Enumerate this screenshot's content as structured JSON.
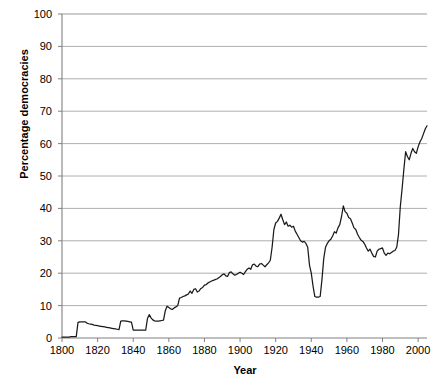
{
  "chart_data": {
    "type": "line",
    "title": "",
    "xlabel": "Year",
    "ylabel": "Percentage democracies",
    "xlim": [
      1800,
      2005
    ],
    "ylim": [
      0,
      100
    ],
    "xticks": [
      1800,
      1820,
      1840,
      1860,
      1880,
      1900,
      1920,
      1940,
      1960,
      1980,
      2000
    ],
    "yticks": [
      0,
      10,
      20,
      30,
      40,
      50,
      60,
      70,
      80,
      90,
      100
    ],
    "grid": "horizontal",
    "legend": "none",
    "line_color": "#1a1a1a",
    "grid_color": "#999999",
    "axis_color": "#808080",
    "background": "#ffffff",
    "series": [
      {
        "name": "Percentage democracies",
        "x": [
          1800,
          1801,
          1802,
          1803,
          1804,
          1805,
          1806,
          1807,
          1808,
          1809,
          1810,
          1811,
          1812,
          1813,
          1814,
          1815,
          1816,
          1817,
          1818,
          1819,
          1820,
          1821,
          1822,
          1823,
          1824,
          1825,
          1826,
          1827,
          1828,
          1829,
          1830,
          1831,
          1832,
          1833,
          1834,
          1835,
          1836,
          1837,
          1838,
          1839,
          1840,
          1841,
          1842,
          1843,
          1844,
          1845,
          1846,
          1847,
          1848,
          1849,
          1850,
          1851,
          1852,
          1853,
          1854,
          1855,
          1856,
          1857,
          1858,
          1859,
          1860,
          1861,
          1862,
          1863,
          1864,
          1865,
          1866,
          1867,
          1868,
          1869,
          1870,
          1871,
          1872,
          1873,
          1874,
          1875,
          1876,
          1877,
          1878,
          1879,
          1880,
          1881,
          1882,
          1883,
          1884,
          1885,
          1886,
          1887,
          1888,
          1889,
          1890,
          1891,
          1892,
          1893,
          1894,
          1895,
          1896,
          1897,
          1898,
          1899,
          1900,
          1901,
          1902,
          1903,
          1904,
          1905,
          1906,
          1907,
          1908,
          1909,
          1910,
          1911,
          1912,
          1913,
          1914,
          1915,
          1916,
          1917,
          1918,
          1919,
          1920,
          1921,
          1922,
          1923,
          1924,
          1925,
          1926,
          1927,
          1928,
          1929,
          1930,
          1931,
          1932,
          1933,
          1934,
          1935,
          1936,
          1937,
          1938,
          1939,
          1940,
          1941,
          1942,
          1943,
          1944,
          1945,
          1946,
          1947,
          1948,
          1949,
          1950,
          1951,
          1952,
          1953,
          1954,
          1955,
          1956,
          1957,
          1958,
          1959,
          1960,
          1961,
          1962,
          1963,
          1964,
          1965,
          1966,
          1967,
          1968,
          1969,
          1970,
          1971,
          1972,
          1973,
          1974,
          1975,
          1976,
          1977,
          1978,
          1979,
          1980,
          1981,
          1982,
          1983,
          1984,
          1985,
          1986,
          1987,
          1988,
          1989,
          1990,
          1991,
          1992,
          1993,
          1994,
          1995,
          1996,
          1997,
          1998,
          1999,
          2000,
          2001,
          2002,
          2003,
          2004,
          2005
        ],
        "y": [
          0.3,
          0.3,
          0.3,
          0.3,
          0.3,
          0.4,
          0.4,
          0.4,
          0.4,
          4.8,
          5.0,
          5.0,
          5.0,
          5.0,
          4.6,
          4.4,
          4.3,
          4.2,
          4.0,
          3.9,
          3.8,
          3.7,
          3.6,
          3.5,
          3.4,
          3.3,
          3.2,
          3.1,
          3.0,
          2.9,
          2.8,
          2.7,
          2.6,
          5.2,
          5.3,
          5.3,
          5.2,
          5.1,
          5.0,
          4.9,
          2.4,
          2.4,
          2.4,
          2.4,
          2.4,
          2.4,
          2.4,
          2.4,
          6.0,
          7.2,
          6.2,
          5.6,
          5.3,
          5.2,
          5.2,
          5.3,
          5.4,
          5.5,
          8.4,
          9.8,
          9.4,
          9.0,
          8.8,
          9.3,
          9.6,
          10.0,
          12.3,
          12.5,
          12.8,
          13.0,
          13.3,
          13.6,
          14.5,
          13.8,
          15.0,
          15.2,
          14.2,
          14.5,
          15.3,
          15.6,
          16.3,
          16.5,
          17.0,
          17.3,
          17.6,
          17.8,
          18.0,
          18.2,
          18.6,
          19.0,
          19.5,
          19.8,
          19.2,
          19.0,
          20.2,
          20.4,
          19.8,
          19.4,
          19.6,
          20.0,
          20.3,
          20.0,
          19.6,
          20.5,
          21.2,
          21.6,
          21.2,
          22.6,
          22.8,
          22.2,
          22.0,
          22.8,
          23.0,
          22.5,
          22.0,
          22.6,
          23.2,
          24.0,
          28.0,
          33.5,
          35.5,
          36.0,
          37.0,
          38.2,
          36.5,
          35.0,
          35.8,
          34.5,
          34.8,
          34.2,
          34.5,
          33.0,
          32.0,
          31.0,
          30.0,
          29.6,
          29.8,
          29.2,
          28.0,
          22.5,
          20.0,
          16.0,
          12.8,
          12.6,
          12.6,
          12.8,
          18.0,
          24.5,
          28.0,
          29.2,
          30.0,
          30.5,
          31.5,
          32.8,
          32.4,
          34.0,
          35.0,
          37.5,
          40.8,
          39.0,
          38.5,
          37.2,
          36.8,
          35.5,
          34.0,
          33.5,
          32.0,
          31.0,
          30.2,
          29.8,
          29.0,
          27.8,
          26.8,
          27.4,
          26.2,
          25.2,
          25.0,
          26.8,
          27.4,
          27.6,
          27.8,
          26.2,
          25.5,
          26.2,
          26.0,
          26.4,
          26.8,
          27.0,
          28.0,
          32.0,
          40.5,
          46.0,
          52.0,
          57.5,
          56.0,
          55.0,
          57.0,
          58.5,
          57.5,
          57.0,
          59.0,
          60.5,
          61.5,
          63.0,
          64.5,
          65.5
        ]
      }
    ]
  }
}
